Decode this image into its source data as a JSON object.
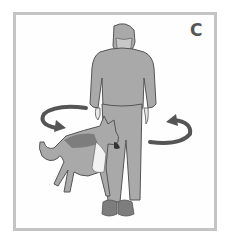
{
  "panel": {
    "label": "C",
    "description": "Man standing still while a German Shepherd dog circles around him; curved arrows indicate circular movement around the person"
  },
  "colors": {
    "frame": "#c4c4c4",
    "figure_fill": "#a9a9a9",
    "figure_dark": "#7d7d7d",
    "outline": "#555555",
    "arrow": "#555555",
    "dog_light": "#f2f2f2"
  }
}
